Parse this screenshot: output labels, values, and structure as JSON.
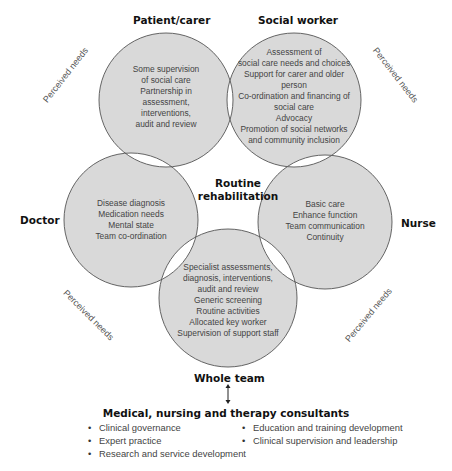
{
  "diagram": {
    "center_label": [
      "Routine",
      "rehabilitation"
    ],
    "circle_fill": "#d9d9d9",
    "overlap_fill": "#ffffff",
    "stroke": "#555555",
    "perceived_needs_label": "Perceived needs",
    "roles": [
      {
        "id": "patient-carer",
        "label": "Patient/carer",
        "items": [
          "Some supervision",
          "of social care",
          "Partnership in",
          "assessment,",
          "interventions,",
          "audit and review"
        ]
      },
      {
        "id": "social-worker",
        "label": "Social worker",
        "items": [
          "Assessment of",
          "social care needs and choices",
          "Support for carer and older",
          "person",
          "Co-ordination and financing of",
          "social care",
          "Advocacy",
          "Promotion of social networks",
          "and community inclusion"
        ]
      },
      {
        "id": "doctor",
        "label": "Doctor",
        "items": [
          "Disease diagnosis",
          "Medication needs",
          "Mental state",
          "Team co-ordination"
        ]
      },
      {
        "id": "nurse",
        "label": "Nurse",
        "items": [
          "Basic care",
          "Enhance function",
          "Team communication",
          "Continuity"
        ]
      },
      {
        "id": "whole-team",
        "label": "Whole team",
        "items": [
          "Specialist assessments,",
          "diagnosis, interventions,",
          "audit and review",
          "Generic screening",
          "Routine activities",
          "Allocated key worker",
          "Supervision of support staff"
        ]
      }
    ]
  },
  "consultants": {
    "title": "Medical, nursing and therapy consultants",
    "left_column": [
      "Clinical governance",
      "Expert practice",
      "Research and service development"
    ],
    "right_column": [
      "Education and training development",
      "Clinical supervision and leadership"
    ]
  }
}
